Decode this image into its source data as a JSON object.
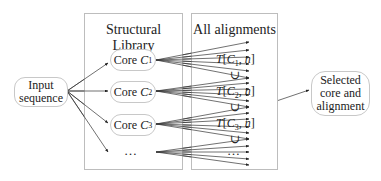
{
  "diagram": {
    "input_node": {
      "line1": "Input",
      "line2": "sequence"
    },
    "library_box": {
      "title": "Structural Library",
      "cores": [
        {
          "prefix": "Core ",
          "var": "C",
          "sub": "1"
        },
        {
          "prefix": "Core ",
          "var": "C",
          "sub": "2"
        },
        {
          "prefix": "Core ",
          "var": "C",
          "sub": "3"
        }
      ],
      "ellipsis": "…"
    },
    "alignments_box": {
      "title": "All alignments",
      "terms": [
        {
          "T": "T",
          "open": "[",
          "var": "C",
          "sub": "1",
          "rest": ", ",
          "n": "n",
          "close": "]"
        },
        {
          "T": "T",
          "open": "[",
          "var": "C",
          "sub": "2",
          "rest": ", ",
          "n": "n",
          "close": "]"
        },
        {
          "T": "T",
          "open": "[",
          "var": "C",
          "sub": "3",
          "rest": ", ",
          "n": "n",
          "close": "]"
        }
      ],
      "union_symbol": "∪",
      "ellipsis": "…"
    },
    "output_node": {
      "line1": "Selected",
      "line2": "core and",
      "line3": "alignment"
    }
  }
}
